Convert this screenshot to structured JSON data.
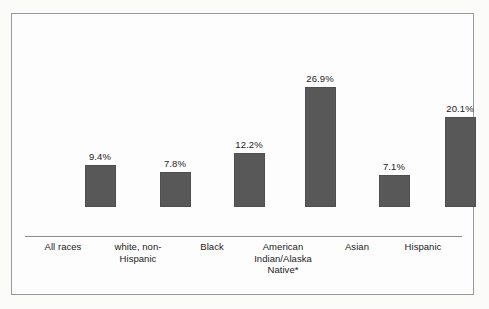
{
  "chart_data": {
    "type": "bar",
    "title": "",
    "subtitle": "",
    "xlabel": "",
    "ylabel": "",
    "grid": false,
    "legend": "none",
    "axis_baseline_visible": true,
    "value_labels_shown": true,
    "bar_color": "#585858",
    "background_color": "#fdfdfd",
    "border_color": "#9a9a9e",
    "text_color": "#1b1b1b",
    "ylim": [
      0,
      30
    ],
    "categories": [
      "All races",
      "white, non-Hispanic",
      "Black",
      "American Indian/Alaska Native*",
      "Asian",
      "Hispanic"
    ],
    "category_label_lines": [
      [
        "All races"
      ],
      [
        "white, non-",
        "Hispanic"
      ],
      [
        "Black"
      ],
      [
        "American",
        "Indian/Alaska",
        "Native*"
      ],
      [
        "Asian"
      ],
      [
        "Hispanic"
      ]
    ],
    "values": [
      9.4,
      7.8,
      12.2,
      26.9,
      7.1,
      20.1
    ],
    "value_labels": [
      "9.4%",
      "7.8%",
      "12.2%",
      "26.9%",
      "7.1%",
      "20.1%"
    ],
    "footnote_marker": "*"
  }
}
